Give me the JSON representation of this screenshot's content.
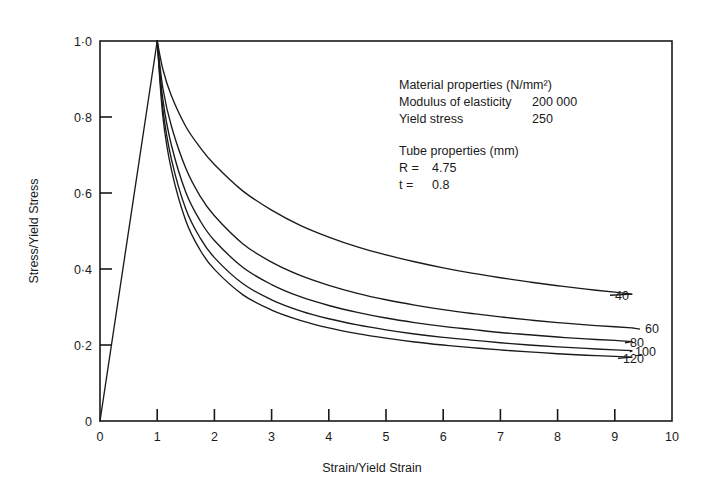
{
  "chart_data": {
    "type": "line",
    "title": "",
    "xlabel": "Strain/Yield Strain",
    "ylabel": "Stress/Yield Stress",
    "xlim": [
      0,
      10
    ],
    "ylim": [
      0,
      1.0
    ],
    "grid": false,
    "legend_position": "inline-right-end-labels",
    "xticks": [
      "0",
      "1",
      "2",
      "3",
      "4",
      "5",
      "6",
      "7",
      "8",
      "9",
      "10"
    ],
    "xtick_values": [
      0,
      1,
      2,
      3,
      4,
      5,
      6,
      7,
      8,
      9,
      10
    ],
    "yticks": [
      "0",
      "0·2",
      "0·4",
      "0·6",
      "0·8",
      "1·0"
    ],
    "ytick_values": [
      0,
      0.2,
      0.4,
      0.6,
      0.8,
      1.0
    ],
    "x": [
      1.0,
      1.1,
      1.25,
      1.5,
      1.75,
      2.0,
      2.5,
      3.0,
      3.5,
      4.0,
      4.5,
      5.0,
      5.5,
      6.0,
      6.5,
      7.0,
      7.5,
      8.0,
      8.5,
      9.0,
      9.3
    ],
    "elastic_branch": {
      "name": "elastic loading",
      "x": [
        0.0,
        1.0
      ],
      "y": [
        0.0,
        1.0
      ]
    },
    "series": [
      {
        "name": "40",
        "label": "40",
        "values": [
          1.0,
          0.925,
          0.855,
          0.775,
          0.72,
          0.675,
          0.605,
          0.555,
          0.515,
          0.484,
          0.458,
          0.437,
          0.419,
          0.403,
          0.389,
          0.377,
          0.366,
          0.356,
          0.347,
          0.339,
          0.334
        ]
      },
      {
        "name": "60",
        "label": "60",
        "values": [
          1.0,
          0.875,
          0.775,
          0.665,
          0.592,
          0.54,
          0.466,
          0.418,
          0.383,
          0.357,
          0.336,
          0.319,
          0.305,
          0.293,
          0.283,
          0.274,
          0.266,
          0.259,
          0.253,
          0.248,
          0.245
        ]
      },
      {
        "name": "80",
        "label": "80",
        "values": [
          1.0,
          0.845,
          0.725,
          0.602,
          0.527,
          0.475,
          0.404,
          0.359,
          0.327,
          0.304,
          0.286,
          0.271,
          0.259,
          0.249,
          0.241,
          0.233,
          0.227,
          0.221,
          0.216,
          0.212,
          0.209
        ]
      },
      {
        "name": "100",
        "label": "100",
        "values": [
          1.0,
          0.82,
          0.688,
          0.558,
          0.482,
          0.43,
          0.361,
          0.319,
          0.29,
          0.269,
          0.253,
          0.24,
          0.229,
          0.22,
          0.213,
          0.206,
          0.2,
          0.195,
          0.191,
          0.187,
          0.185
        ]
      },
      {
        "name": "120",
        "label": "120",
        "values": [
          1.0,
          0.8,
          0.66,
          0.527,
          0.45,
          0.399,
          0.332,
          0.292,
          0.265,
          0.245,
          0.23,
          0.218,
          0.208,
          0.2,
          0.193,
          0.187,
          0.182,
          0.177,
          0.173,
          0.17,
          0.168
        ]
      }
    ],
    "annotations": [
      "Material properties (N/mm²)",
      "Modulus of elasticity 200 000",
      "Yield stress            250",
      "Tube properties (mm)",
      "R  =  4.75",
      "t  =  0.8"
    ]
  },
  "annotation_block": {
    "line1": "Material properties (N/mm²)",
    "line2_label": "Modulus of elasticity",
    "line2_value": "200 000",
    "line3_label": "Yield stress",
    "line3_value": "250",
    "line4": "Tube properties (mm)",
    "line5_label": "R  =",
    "line5_value": "4.75",
    "line6_label": "t  =",
    "line6_value": "0.8"
  },
  "axes": {
    "x_title": "Strain/Yield Strain",
    "y_title": "Stress/Yield Stress"
  },
  "colors": {
    "line": "#1a1a1a",
    "axis": "#1a1a1a",
    "background": "#ffffff",
    "text": "#1a1a1a"
  }
}
